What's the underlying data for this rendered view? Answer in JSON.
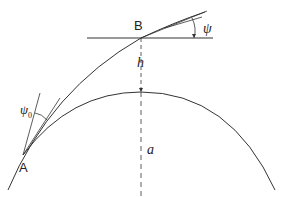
{
  "diagram": {
    "type": "geometry",
    "labels": {
      "point_b": "B",
      "point_a": "A",
      "angle_psi": "ψ",
      "angle_psi0": "ψ",
      "angle_psi0_sub": "0",
      "height": "h",
      "radius": "a"
    },
    "colors": {
      "line": "#333333",
      "background": "#ffffff"
    }
  }
}
